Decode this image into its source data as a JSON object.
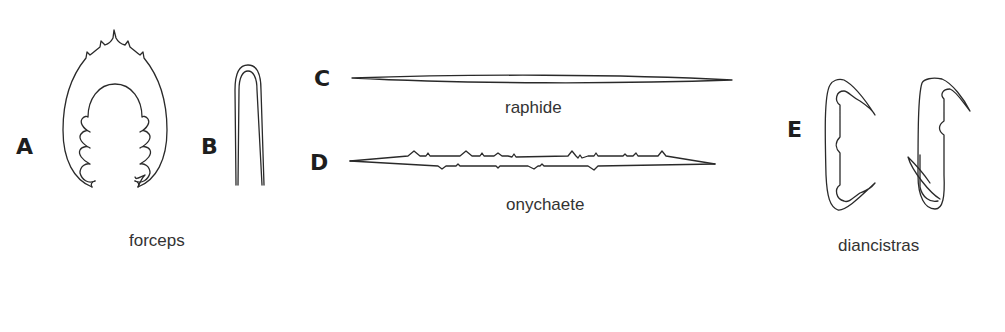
{
  "figure": {
    "panels": [
      {
        "id": "A",
        "letter": "A",
        "shape": "forceps-spiked"
      },
      {
        "id": "B",
        "letter": "B",
        "shape": "forceps-simple"
      },
      {
        "id": "C",
        "letter": "C",
        "shape": "raphide",
        "caption": "raphide"
      },
      {
        "id": "D",
        "letter": "D",
        "shape": "onychaete",
        "caption": "onychaete"
      },
      {
        "id": "E",
        "letter": "E",
        "shape": "diancistras",
        "caption": "diancistras"
      }
    ],
    "group_captions": {
      "forceps": "forceps"
    },
    "colors": {
      "background": "#ffffff",
      "stroke": "#2a2a2a",
      "text": "#333333"
    }
  }
}
